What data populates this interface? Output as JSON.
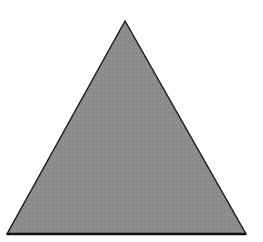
{
  "diagram": {
    "shape": "triangle",
    "kind": "equilateral",
    "vertices": {
      "apex": [
        125,
        21
      ],
      "bottom_left": [
        7,
        234
      ],
      "bottom_right": [
        246,
        234
      ]
    },
    "fill_color": "#8c8c8c",
    "stroke_color": "#1e1e1e",
    "stroke_width": 2,
    "background_color": "#ffffff"
  }
}
